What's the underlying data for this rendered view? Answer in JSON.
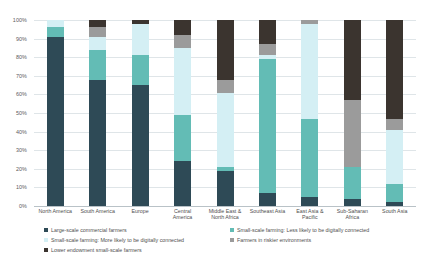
{
  "chart_data": {
    "type": "bar",
    "stacked": true,
    "normalized_percent": true,
    "title": "",
    "xlabel": "",
    "ylabel": "",
    "ylim": [
      0,
      100
    ],
    "grid": true,
    "legend_position": "bottom",
    "categories": [
      "North America",
      "South America",
      "Europe",
      "Central America",
      "Middle East & North Africa",
      "Southeast Asia",
      "East Asia & Pacific",
      "Sub-Saharan Africa",
      "South Asia"
    ],
    "category_lines": [
      [
        "North America"
      ],
      [
        "South America"
      ],
      [
        "Europe"
      ],
      [
        "Central",
        "America"
      ],
      [
        "Middle East &",
        "North Africa"
      ],
      [
        "Southeast Asia"
      ],
      [
        "East Asia &",
        "Pacific"
      ],
      [
        "Sub-Saharan",
        "Africa"
      ],
      [
        "South Asia"
      ]
    ],
    "y_ticks": [
      "0%",
      "10%",
      "20%",
      "30%",
      "40%",
      "50%",
      "60%",
      "70%",
      "80%",
      "90%",
      "100%"
    ],
    "y_tick_values": [
      0,
      10,
      20,
      30,
      40,
      50,
      60,
      70,
      80,
      90,
      100
    ],
    "series": [
      {
        "name": "Large-scale commercial farmers",
        "color": "#2e4a56",
        "values": [
          91,
          68,
          65,
          24,
          19,
          7,
          5,
          4,
          2
        ]
      },
      {
        "name": "Small-scale farming: Less likely to be digitally connected",
        "color": "#63bcb5",
        "values": [
          5,
          16,
          16,
          25,
          2,
          72,
          42,
          17,
          10
        ]
      },
      {
        "name": "Small-scale farming: More likely to be digitally connected",
        "color": "#d4eff4",
        "values": [
          4,
          7,
          17,
          36,
          40,
          2,
          51,
          0,
          29
        ]
      },
      {
        "name": "Farmers in riskier environments",
        "color": "#9b9b9b",
        "values": [
          0,
          5,
          0,
          7,
          7,
          6,
          2,
          36,
          6
        ]
      },
      {
        "name": "Lower endowment small-scale farmers",
        "color": "#3b342f",
        "values": [
          0,
          4,
          2,
          8,
          32,
          13,
          0,
          43,
          53
        ]
      }
    ]
  },
  "legend": {
    "items": [
      {
        "label": "Large-scale commercial farmers",
        "color": "#2e4a56"
      },
      {
        "label": "Small-scale farming: Less likely to be digitally connected",
        "color": "#63bcb5"
      },
      {
        "label": "Small-scale farming: More likely to be digitally connected",
        "color": "#d4eff4"
      },
      {
        "label": "Farmers in riskier environments",
        "color": "#9b9b9b"
      },
      {
        "label": "Lower endowment small-scale farmers",
        "color": "#3b342f"
      }
    ]
  }
}
